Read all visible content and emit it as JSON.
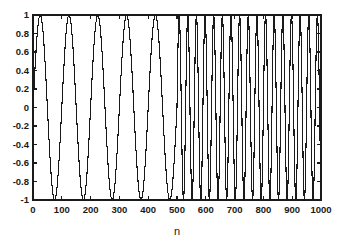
{
  "figure": {
    "background_color": "#ffffff",
    "axes_color": "#1a1a1a",
    "line_color": "#1a1a1a"
  },
  "chart_data": {
    "type": "line",
    "title": "",
    "subtitle": "",
    "xlabel": "n",
    "ylabel": "",
    "xlim": [
      0,
      1000
    ],
    "ylim": [
      -1,
      1
    ],
    "grid": false,
    "legend": [],
    "legend_position": "none",
    "xticks": [
      0,
      100,
      200,
      300,
      400,
      500,
      600,
      700,
      800,
      900,
      1000
    ],
    "xtick_labels": [
      "0",
      "100",
      "200",
      "300",
      "400",
      "500",
      "600",
      "700",
      "800",
      "900",
      "1000"
    ],
    "yticks": [
      -1,
      -0.8,
      -0.6,
      -0.4,
      -0.2,
      0,
      0.2,
      0.4,
      0.6,
      0.8,
      1
    ],
    "ytick_labels": [
      "-1",
      "-0.8",
      "-0.6",
      "-0.4",
      "-0.2",
      "0",
      "0.2",
      "0.4",
      "0.6",
      "0.8",
      "1"
    ],
    "series": [
      {
        "name": "x[n]",
        "segments": [
          {
            "n_start": 0,
            "n_end": 500,
            "waveform": "sine",
            "amplitude": 1,
            "period_samples": 100,
            "cycles": 5,
            "phase_deg": 0
          },
          {
            "n_start": 500,
            "n_end": 1000,
            "waveform": "sine",
            "amplitude": 1,
            "period_samples": 30,
            "cycles": 16.7,
            "phase_deg": 0
          }
        ]
      }
    ],
    "annotations": [
      {
        "text": "frequency change",
        "at_n": 500,
        "visible": false
      }
    ]
  },
  "axes_geometry": {
    "left_px": 33,
    "right_px": 321,
    "top_px": 15,
    "bottom_px": 200,
    "tick_length_px": 4
  },
  "xlabel_text": "n"
}
